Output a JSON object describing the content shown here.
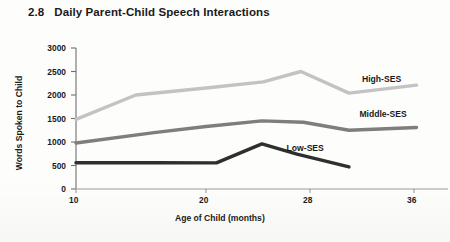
{
  "figure": {
    "number": "2.8",
    "title": "Daily Parent-Child Speech Interactions"
  },
  "chart_data": {
    "type": "line",
    "title": "Daily Parent-Child Speech Interactions",
    "xlabel": "Age of Child (months)",
    "ylabel": "Words Spoken to Child",
    "xlim": [
      10,
      38
    ],
    "ylim": [
      0,
      3000
    ],
    "xticks": [
      10,
      20,
      28,
      36
    ],
    "xtick_labels": [
      "10",
      "20",
      "28",
      "36"
    ],
    "yticks": [
      0,
      500,
      1000,
      1500,
      2000,
      2500,
      3000
    ],
    "ytick_labels": [
      "0",
      "500",
      "1000",
      "1500",
      "2000",
      "2500",
      "3000"
    ],
    "grid": false,
    "legend": "inline-labels",
    "series": [
      {
        "name": "High-SES",
        "color": "#c3c3c3",
        "label_x": 32,
        "label_y": 2320,
        "points": [
          {
            "x": 10.0,
            "y": 1480
          },
          {
            "x": 14.6,
            "y": 2000
          },
          {
            "x": 20.0,
            "y": 2150
          },
          {
            "x": 24.4,
            "y": 2280
          },
          {
            "x": 27.3,
            "y": 2500
          },
          {
            "x": 31.0,
            "y": 2040
          },
          {
            "x": 36.2,
            "y": 2210
          }
        ]
      },
      {
        "name": "Middle-SES",
        "color": "#7e7e7e",
        "label_x": 31.8,
        "label_y": 1580,
        "points": [
          {
            "x": 10.0,
            "y": 980
          },
          {
            "x": 16.0,
            "y": 1200
          },
          {
            "x": 20.0,
            "y": 1330
          },
          {
            "x": 24.3,
            "y": 1450
          },
          {
            "x": 27.5,
            "y": 1420
          },
          {
            "x": 31.0,
            "y": 1250
          },
          {
            "x": 36.2,
            "y": 1310
          }
        ]
      },
      {
        "name": "Low-SES",
        "color": "#2f2f2f",
        "label_x": 26.2,
        "label_y": 860,
        "points": [
          {
            "x": 10.0,
            "y": 560
          },
          {
            "x": 16.0,
            "y": 560
          },
          {
            "x": 20.8,
            "y": 555
          },
          {
            "x": 24.3,
            "y": 960
          },
          {
            "x": 27.0,
            "y": 740
          },
          {
            "x": 31.0,
            "y": 470
          }
        ]
      }
    ]
  }
}
